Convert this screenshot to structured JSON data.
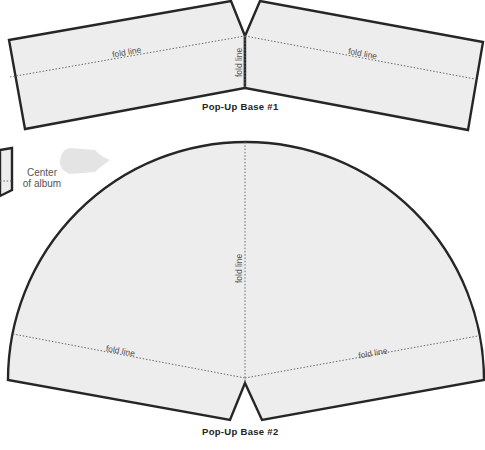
{
  "pieces": [
    {
      "title": "Pop-Up Base #1",
      "fold_labels": [
        "fold line",
        "fold line",
        "fold line"
      ]
    },
    {
      "title": "Pop-Up Base #2",
      "fold_labels": [
        "fold line",
        "fold line",
        "fold line"
      ]
    }
  ],
  "center_marker": {
    "line1": "Center",
    "line2": "of album"
  },
  "colors": {
    "paper": "#ededed",
    "cut_line": "#262626",
    "fold_line": "#6a6a6a"
  }
}
